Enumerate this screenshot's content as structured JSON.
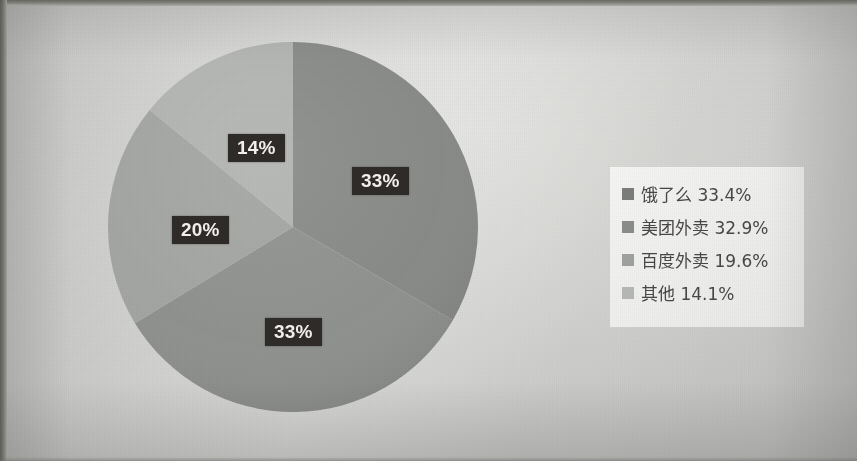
{
  "chart_data": {
    "type": "pie",
    "title": "",
    "categories": [
      "饿了么",
      "美团外卖",
      "百度外卖",
      "其他"
    ],
    "values": [
      33.4,
      32.9,
      19.6,
      14.1
    ],
    "unit": "%",
    "legend_position": "right",
    "start_angle_deg": 0,
    "direction": "clockwise",
    "grid": false,
    "slice_labels": [
      "33%",
      "33%",
      "20%",
      "14%"
    ],
    "legend_entries": [
      {
        "label": "饿了么",
        "value": "33.4%",
        "text": "饿了么 33.4%",
        "color": "#7b7d7a"
      },
      {
        "label": "美团外卖",
        "value": "32.9%",
        "text": "美团外卖 32.9%",
        "color": "#8b8d8a"
      },
      {
        "label": "百度外卖",
        "value": "19.6%",
        "text": "百度外卖 19.6%",
        "color": "#a0a29f"
      },
      {
        "label": "其他",
        "value": "14.1%",
        "text": "其他 14.1%",
        "color": "#b6b8b5"
      }
    ],
    "slices": [
      {
        "name": "饿了么",
        "percent": 33.4,
        "label": "33%",
        "color": "#878986",
        "start": 0,
        "sweep": 120.24
      },
      {
        "name": "美团外卖",
        "percent": 32.9,
        "label": "33%",
        "color": "#8e908d",
        "start": 120.24,
        "sweep": 118.44
      },
      {
        "name": "百度外卖",
        "percent": 19.6,
        "label": "20%",
        "color": "#a2a4a1",
        "start": 238.68,
        "sweep": 70.56
      },
      {
        "name": "其他",
        "percent": 14.1,
        "label": "14%",
        "color": "#b1b3b0",
        "start": 309.24,
        "sweep": 50.76
      }
    ],
    "label_color_bg": "#2f2b28",
    "label_color_fg": "#f4f2ef"
  },
  "labels": {
    "eleme": "33%",
    "meituan": "33%",
    "baidu": "20%",
    "other": "14%"
  }
}
